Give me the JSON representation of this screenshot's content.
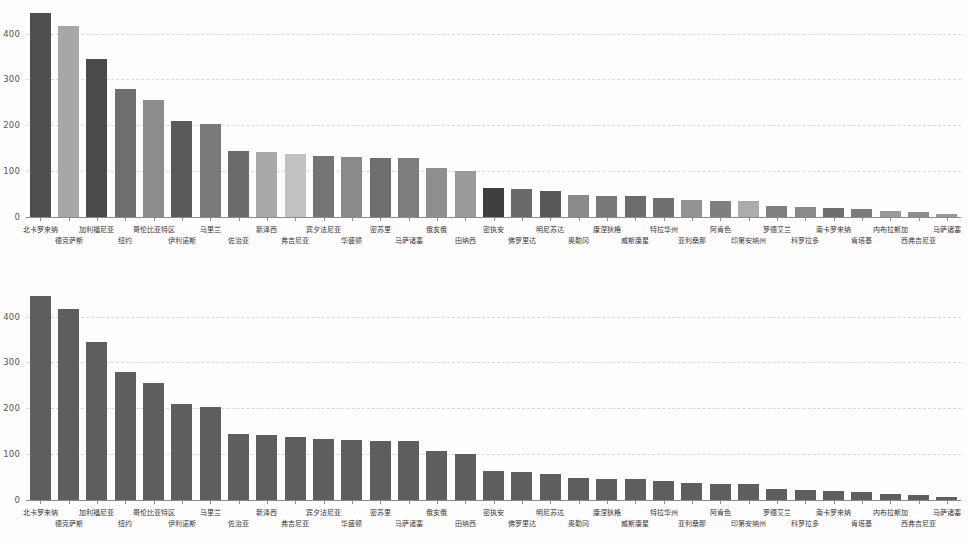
{
  "chart_data": [
    {
      "type": "bar",
      "title": "",
      "xlabel": "",
      "ylabel": "",
      "ylim": [
        0,
        460
      ],
      "yticks": [
        0,
        100,
        200,
        300,
        400
      ],
      "ytick_labels": [
        "0",
        "100",
        "200",
        "300",
        "400"
      ],
      "grid": true,
      "legend": "none",
      "alternating_shades": true,
      "categories": [
        "北卡罗来纳",
        "德克萨斯",
        "加利福尼亚",
        "纽约",
        "哥伦比亚特区",
        "伊利诺斯",
        "马里兰",
        "佐治亚",
        "新泽西",
        "弗吉尼亚",
        "宾夕法尼亚",
        "华盛顿",
        "密苏里",
        "马萨诸塞",
        "俄亥俄",
        "田纳西",
        "密执安",
        "佛罗里达",
        "明尼苏达",
        "奥勒冈",
        "康涅狄格",
        "威斯康星",
        "特拉华州",
        "亚利桑那",
        "阿肯色",
        "印第安纳州",
        "罗德艾兰",
        "科罗拉多",
        "南卡罗来纳",
        "肯塔基",
        "内布拉斯加",
        "西弗吉尼亚",
        "马萨诸塞"
      ],
      "values": [
        445,
        417,
        345,
        280,
        256,
        210,
        203,
        145,
        141,
        137,
        132,
        130,
        129,
        128,
        107,
        100,
        63,
        60,
        57,
        48,
        46,
        45,
        42,
        38,
        36,
        34,
        24,
        22,
        20,
        18,
        14,
        11,
        7
      ],
      "bar_colors": [
        "#4f4f4f",
        "#a8a8a8",
        "#4a4a4a",
        "#6e6e6e",
        "#8d8d8d",
        "#5a5a5a",
        "#7a7a7a",
        "#6b6b6b",
        "#a9a9a9",
        "#c2c2c2",
        "#757575",
        "#8a8a8a",
        "#6f6f6f",
        "#7d7d7d",
        "#8f8f8f",
        "#9b9b9b",
        "#3f3f3f",
        "#6a6a6a",
        "#585858",
        "#8b8b8b",
        "#787878",
        "#6c6c6c",
        "#707070",
        "#949494",
        "#7f7f7f",
        "#adadad",
        "#808080",
        "#8a8a8a",
        "#6d6d6d",
        "#7c7c7c",
        "#9a9a9a",
        "#8d8d8d",
        "#999999"
      ]
    },
    {
      "type": "bar",
      "title": "",
      "xlabel": "",
      "ylabel": "",
      "ylim": [
        0,
        460
      ],
      "yticks": [
        0,
        100,
        200,
        300,
        400
      ],
      "ytick_labels": [
        "0",
        "100",
        "200",
        "300",
        "400"
      ],
      "grid": true,
      "legend": "none",
      "alternating_shades": false,
      "uniform_bar_color": "#5f5f5f",
      "categories": [
        "北卡罗来纳",
        "德克萨斯",
        "加利福尼亚",
        "纽约",
        "哥伦比亚特区",
        "伊利诺斯",
        "马里兰",
        "佐治亚",
        "新泽西",
        "弗吉尼亚",
        "宾夕法尼亚",
        "华盛顿",
        "密苏里",
        "马萨诸塞",
        "俄亥俄",
        "田纳西",
        "密执安",
        "佛罗里达",
        "明尼苏达",
        "奥勒冈",
        "康涅狄格",
        "威斯康星",
        "特拉华州",
        "亚利桑那",
        "阿肯色",
        "印第安纳州",
        "罗德艾兰",
        "科罗拉多",
        "南卡罗来纳",
        "肯塔基",
        "内布拉斯加",
        "西弗吉尼亚",
        "马萨诸塞"
      ],
      "values": [
        445,
        417,
        345,
        280,
        256,
        210,
        203,
        145,
        141,
        137,
        132,
        130,
        129,
        128,
        107,
        100,
        63,
        60,
        57,
        48,
        46,
        45,
        42,
        38,
        36,
        34,
        24,
        22,
        20,
        18,
        14,
        11,
        7
      ]
    }
  ],
  "charts": [
    {
      "name": "top-chart"
    },
    {
      "name": "bottom-chart"
    }
  ]
}
